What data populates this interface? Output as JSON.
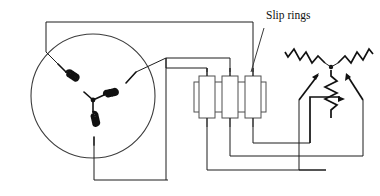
{
  "diagram": {
    "labels": {
      "slip_rings": "Slip rings"
    },
    "colors": {
      "wire": "#1d1d1d",
      "frame": "#4a4a4a",
      "coil": "#111111",
      "ring_outline": "#4f4f4f",
      "background": "#ffffff",
      "text": "#111111"
    },
    "stator": {
      "name": "stator-circle",
      "center_x": 93,
      "center_y": 96,
      "radius": 62,
      "winding_count": 3,
      "connection": "wye",
      "windings": [
        {
          "name": "winding-left",
          "turns": 5,
          "angle_deg": 200
        },
        {
          "name": "winding-right",
          "turns": 5,
          "angle_deg": 340
        },
        {
          "name": "winding-bottom",
          "turns": 5,
          "angle_deg": 90
        }
      ]
    },
    "slip_rings": {
      "count": 3,
      "rings": [
        {
          "name": "slip-ring-1",
          "x": 199,
          "y": 76,
          "width": 16,
          "height": 42
        },
        {
          "name": "slip-ring-2",
          "x": 222,
          "y": 76,
          "width": 16,
          "height": 42
        },
        {
          "name": "slip-ring-3",
          "x": 245,
          "y": 76,
          "width": 16,
          "height": 42
        }
      ],
      "band": {
        "name": "slip-ring-band",
        "x": 194,
        "y": 82,
        "width": 72,
        "height": 30
      }
    },
    "rheostat": {
      "name": "three-phase-rheostat",
      "connection": "wye",
      "resistor_count": 3,
      "resistors": [
        {
          "name": "rheostat-resistor-left",
          "zigzags": 4
        },
        {
          "name": "rheostat-resistor-right",
          "zigzags": 4
        },
        {
          "name": "rheostat-resistor-center",
          "zigzags": 4
        }
      ],
      "wipers": 3
    },
    "leader_line": {
      "name": "slip-rings-leader",
      "from_x": 264,
      "from_y": 28,
      "to_x": 251,
      "to_y": 72
    }
  }
}
